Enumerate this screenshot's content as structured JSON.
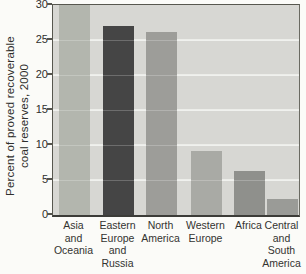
{
  "chart_data": {
    "type": "bar",
    "title": "",
    "xlabel": "",
    "ylabel": "Percent of proved recoverable coal reserves, 2000",
    "ylabel_lines": [
      "Percent of proved recoverable",
      "coal reserves, 2000"
    ],
    "ylim": [
      0,
      30
    ],
    "yticks": [
      0,
      5,
      10,
      15,
      20,
      25,
      30
    ],
    "grid": true,
    "legend": false,
    "categories": [
      "Asia and Oceania",
      "Eastern Europe and Russia",
      "North America",
      "Western Europe",
      "Africa",
      "Central and South America"
    ],
    "category_label_lines": [
      [
        "Asia",
        "and",
        "Oceania"
      ],
      [
        "Eastern",
        "Europe",
        "and",
        "Russia"
      ],
      [
        "North",
        "America"
      ],
      [
        "Western",
        "Europe"
      ],
      [
        "Africa"
      ],
      [
        "Central",
        "and",
        "South",
        "America"
      ]
    ],
    "values": [
      30,
      27,
      26.2,
      9.2,
      6.3,
      2.3
    ],
    "bar_colors": [
      "#b3b6ae",
      "#454545",
      "#9d9d99",
      "#a9aaa5",
      "#8f908c",
      "#9a9b97"
    ],
    "plot_background": "#d7d7d3",
    "gridline_color": "#ecede9",
    "axis_color": "#4a4a46",
    "text_color": "#2f2f2d"
  }
}
